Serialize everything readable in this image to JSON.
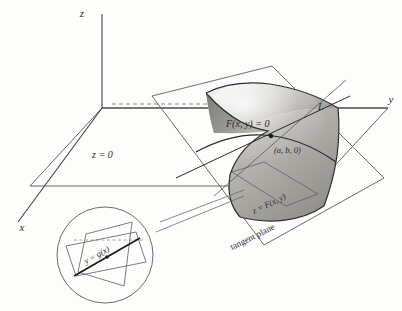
{
  "figure": {
    "background_color": "#fdfdfc",
    "line_color": "#4a4a4a",
    "text_color": "#2b2b2b"
  },
  "axes": {
    "z_label": "z",
    "y_label": "y",
    "x_label": "x"
  },
  "labels": {
    "z_plane": "z = 0",
    "implicit_curve": "F(x, y) = 0",
    "point": "(a, b, 0)",
    "line_L": "L",
    "surface": "z = F(x, y)",
    "tangent_plane": "tangent plane",
    "inset_curve": "y = g(x)"
  },
  "colors": {
    "surface_light": "#f2f1ef",
    "surface_mid": "#b9b7b3",
    "surface_dark": "#8e8c88",
    "surface_edge": "#3a3a3a",
    "plane_stroke": "#5a5a5a",
    "axis_stroke": "#3f3f3f",
    "dashed_stroke": "#6e6e6e"
  }
}
